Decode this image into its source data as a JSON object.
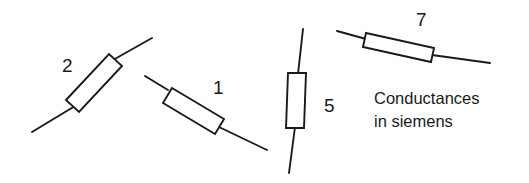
{
  "figure": {
    "width": 529,
    "height": 183,
    "background_color": "#ffffff",
    "ink_color": "#1a1a1a",
    "caption": {
      "line1": "Conductances",
      "line2": "in siemens"
    },
    "components": [
      {
        "id": "resistor-2",
        "type": "resistor",
        "value_label": "2",
        "unit": "siemens",
        "orientation_degrees": -32,
        "label_position": {
          "x": 62,
          "y": 56
        },
        "lead_start": {
          "x": 32,
          "y": 132
        },
        "lead_end": {
          "x": 152,
          "y": 38
        },
        "body_polygon": "66,100 109,54 122,66 79,112"
      },
      {
        "id": "resistor-1",
        "type": "resistor",
        "value_label": "1",
        "unit": "siemens",
        "orientation_degrees": 25,
        "label_position": {
          "x": 213,
          "y": 78
        },
        "lead_start": {
          "x": 145,
          "y": 76
        },
        "lead_end": {
          "x": 267,
          "y": 150
        },
        "body_polygon": "172,88 224,119 215,134 163,103"
      },
      {
        "id": "resistor-5",
        "type": "resistor",
        "value_label": "5",
        "unit": "siemens",
        "orientation_degrees": 94,
        "label_position": {
          "x": 324,
          "y": 96
        },
        "lead_start": {
          "x": 303,
          "y": 29
        },
        "lead_end": {
          "x": 289,
          "y": 173
        },
        "body_polygon": "288,73 306,73 304,128 286,128"
      },
      {
        "id": "resistor-7",
        "type": "resistor",
        "value_label": "7",
        "unit": "siemens",
        "orientation_degrees": 15,
        "label_position": {
          "x": 416,
          "y": 10
        },
        "lead_start": {
          "x": 337,
          "y": 31
        },
        "lead_end": {
          "x": 490,
          "y": 63
        },
        "body_polygon": "366,33 434,48 431,62 363,47"
      }
    ]
  }
}
